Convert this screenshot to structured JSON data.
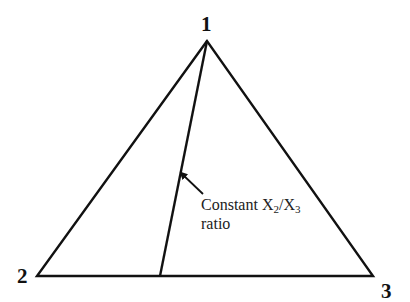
{
  "diagram": {
    "type": "ternary-diagram",
    "vertices": [
      {
        "id": "1",
        "label": "1",
        "x": 207,
        "y": 41
      },
      {
        "id": "2",
        "label": "2",
        "x": 37,
        "y": 276
      },
      {
        "id": "3",
        "label": "3",
        "x": 373,
        "y": 276
      }
    ],
    "constant_ratio_line": {
      "from_vertex": "1",
      "to_edge_point": {
        "x": 160,
        "y": 276
      }
    },
    "annotation": {
      "line1_prefix": "Constant X",
      "sub1": "2",
      "slash": "/X",
      "sub2": "3",
      "line2": "ratio"
    },
    "colors": {
      "stroke": "#111111",
      "background": "#ffffff"
    }
  }
}
